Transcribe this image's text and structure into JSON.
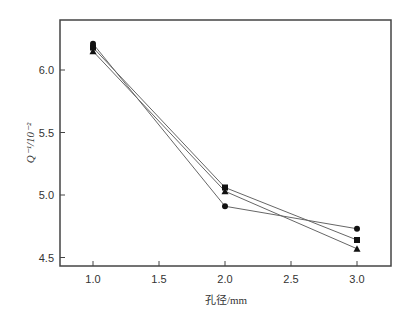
{
  "chart_data": {
    "type": "line",
    "title": "",
    "xlabel": "孔径/mm",
    "ylabel": "Q⁻¹/10⁻²",
    "x": [
      1.0,
      2.0,
      3.0
    ],
    "xlim": [
      0.83,
      3.17
    ],
    "ylim": [
      4.43,
      6.4
    ],
    "xticks": [
      "1.0",
      "1.5",
      "2.0",
      "2.5",
      "3.0"
    ],
    "yticks": [
      "4.5",
      "5.0",
      "5.5",
      "6.0"
    ],
    "grid": false,
    "legend": null,
    "series": [
      {
        "name": "circle",
        "marker": "circle",
        "values": [
          6.21,
          4.91,
          4.73
        ]
      },
      {
        "name": "square",
        "marker": "square",
        "values": [
          6.18,
          5.06,
          4.64
        ]
      },
      {
        "name": "triangle",
        "marker": "triangle",
        "values": [
          6.15,
          5.03,
          4.57
        ]
      }
    ]
  }
}
